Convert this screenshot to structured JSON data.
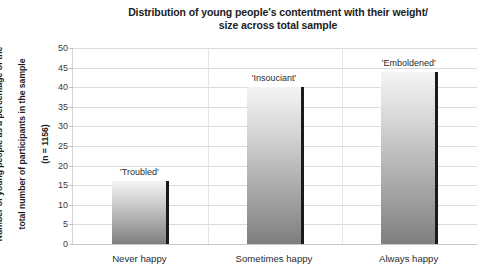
{
  "chart_data": {
    "type": "bar",
    "title": "Distribution of young people's contentment with their weight/ size across total sample",
    "title_lines": [
      "Distribution of young people's contentment with their weight/",
      "size across total sample"
    ],
    "xlabel": "",
    "ylabel": "Number of young people as a percentage of the total number of participants in the sample (n = 1156)",
    "ylabel_lines": [
      "Number of young people as a percentage of the",
      "total number of participants in the sample",
      "(n = 1156)"
    ],
    "categories": [
      "Never happy",
      "Sometimes happy",
      "Always happy"
    ],
    "values": [
      16,
      40,
      44
    ],
    "point_labels": [
      "'Troubled'",
      "'Insouciant'",
      "'Emboldened'"
    ],
    "ylim": [
      0,
      50
    ],
    "ytick_step": 5,
    "yticks": [
      50,
      45,
      40,
      35,
      30,
      25,
      20,
      15,
      10,
      5,
      0
    ],
    "grid": true,
    "legend": "none",
    "series": [
      {
        "name": "Contentment with weight/size",
        "values": [
          16,
          40,
          44
        ]
      }
    ],
    "colors": {
      "bar_top": "#f4f4f4",
      "bar_bottom": "#7e7e7e",
      "bar_edge": "#1a1a1a",
      "gridline": "#dcdcdc",
      "text": "#262626",
      "background": "#ffffff"
    }
  }
}
